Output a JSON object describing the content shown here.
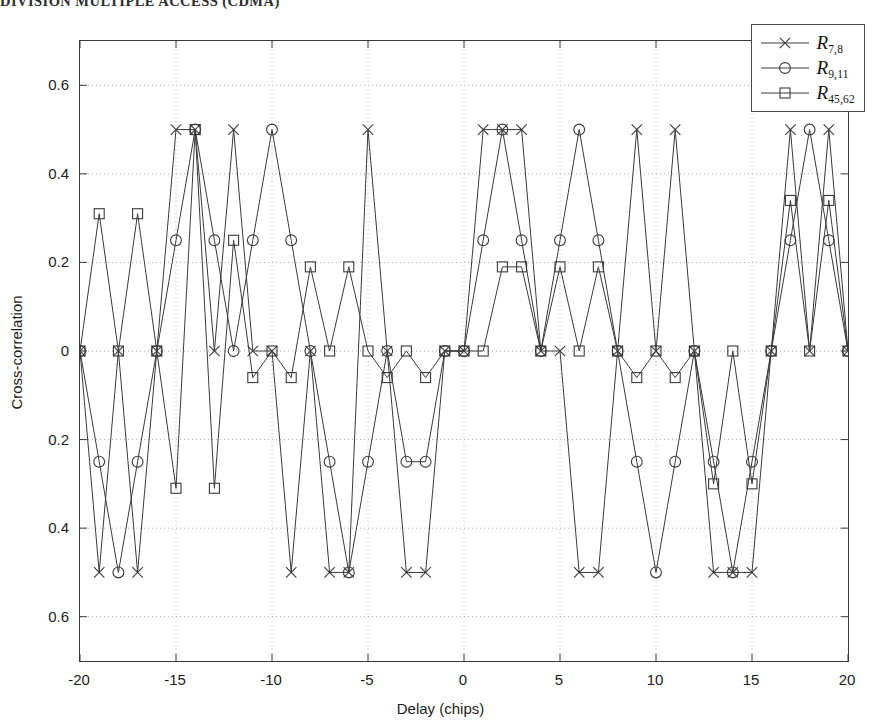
{
  "page_header": "DIVISION MULTIPLE ACCESS (CDMA)",
  "figure": {
    "xlabel": "Delay (chips)",
    "ylabel": "Cross-correlation",
    "x_ticks": [
      "-20",
      "-15",
      "-10",
      "-5",
      "0",
      "5",
      "10",
      "15",
      "20"
    ],
    "y_ticks": [
      "0.6",
      "0.4",
      "0.2",
      "0",
      "0.2",
      "0.4",
      "0.6"
    ],
    "legend": [
      {
        "symbol": "x-marker-icon",
        "label_base": "R",
        "label_sub": "7,8"
      },
      {
        "symbol": "circle-marker-icon",
        "label_base": "R",
        "label_sub": "9,11"
      },
      {
        "symbol": "square-marker-icon",
        "label_base": "R",
        "label_sub": "45,62"
      }
    ]
  },
  "chart_data": {
    "type": "line",
    "title": "",
    "xlabel": "Delay (chips)",
    "ylabel": "Cross-correlation",
    "xlim": [
      -20,
      20
    ],
    "ylim": [
      -0.7,
      0.7
    ],
    "xticks": [
      -20,
      -15,
      -10,
      -5,
      0,
      5,
      10,
      15,
      20
    ],
    "yticks": [
      -0.6,
      -0.4,
      -0.2,
      0,
      0.2,
      0.4,
      0.6
    ],
    "ytick_labels": [
      "0.6",
      "0.4",
      "0.2",
      "0",
      "0.2",
      "0.4",
      "0.6"
    ],
    "grid": true,
    "grid_style": "dotted",
    "legend_position": "upper right",
    "line_color": "#3a3a3a",
    "x": [
      -20,
      -19,
      -18,
      -17,
      -16,
      -15,
      -14,
      -13,
      -12,
      -11,
      -10,
      -9,
      -8,
      -7,
      -6,
      -5,
      -4,
      -3,
      -2,
      -1,
      0,
      1,
      2,
      3,
      4,
      5,
      6,
      7,
      8,
      9,
      10,
      11,
      12,
      13,
      14,
      15,
      16,
      17,
      18,
      19,
      20
    ],
    "series": [
      {
        "name": "R_7,8",
        "marker": "x",
        "values": [
          0,
          -0.5,
          0,
          -0.5,
          0,
          0.5,
          0.5,
          0,
          0.5,
          0,
          0,
          -0.5,
          0,
          -0.5,
          -0.5,
          0.5,
          0,
          -0.5,
          -0.5,
          0,
          0,
          0.5,
          0.5,
          0.5,
          0,
          0,
          -0.5,
          -0.5,
          0,
          0.5,
          0,
          0.5,
          0,
          -0.5,
          -0.5,
          -0.5,
          0,
          0.5,
          0,
          0.5,
          0
        ]
      },
      {
        "name": "R_9,11",
        "marker": "o",
        "values": [
          0,
          -0.25,
          -0.5,
          -0.25,
          0,
          0.25,
          0.5,
          0.25,
          0,
          0.25,
          0.5,
          0.25,
          0,
          -0.25,
          -0.5,
          -0.25,
          0,
          -0.25,
          -0.25,
          0,
          0,
          0.25,
          0.5,
          0.25,
          0,
          0.25,
          0.5,
          0.25,
          0,
          -0.25,
          -0.5,
          -0.25,
          0,
          -0.25,
          -0.5,
          -0.25,
          0,
          0.25,
          0.5,
          0.25,
          0
        ]
      },
      {
        "name": "R_45,62",
        "marker": "s",
        "values": [
          0,
          0.31,
          0,
          0.31,
          0,
          -0.31,
          0.5,
          -0.31,
          0.25,
          -0.06,
          0,
          -0.06,
          0.19,
          0,
          0.19,
          0,
          -0.06,
          0,
          -0.06,
          0,
          0,
          0,
          0.19,
          0.19,
          0,
          0.19,
          0,
          0.19,
          0,
          -0.06,
          0,
          -0.06,
          0,
          -0.3,
          0,
          -0.3,
          0,
          0.34,
          0,
          0.34,
          0
        ]
      }
    ]
  }
}
